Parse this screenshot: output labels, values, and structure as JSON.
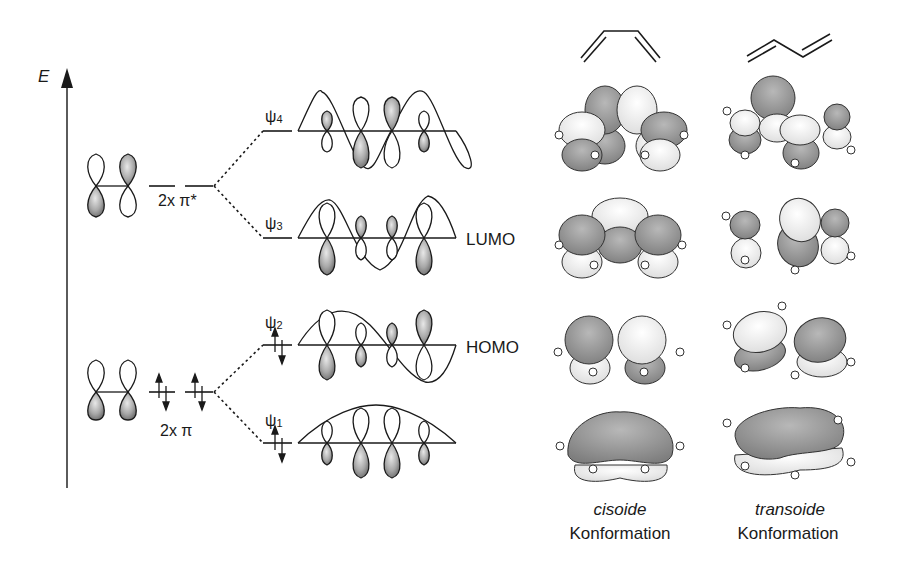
{
  "axis": {
    "label": "E"
  },
  "ethene_levels": {
    "antibonding_label": "2x π*",
    "bonding_label": "2x π"
  },
  "butadiene_mos": [
    {
      "name": "ψ",
      "index": "4",
      "tag": ""
    },
    {
      "name": "ψ",
      "index": "3",
      "tag": "LUMO"
    },
    {
      "name": "ψ",
      "index": "2",
      "tag": "HOMO"
    },
    {
      "name": "ψ",
      "index": "1",
      "tag": ""
    }
  ],
  "conformations": [
    {
      "name": "cisoide",
      "label": "Konformation"
    },
    {
      "name": "transoide",
      "label": "Konformation"
    }
  ],
  "colors": {
    "line": "#1a1a1a",
    "lobe_dark": "#8a8a8a",
    "lobe_mid": "#b5b5b5",
    "surface_dark": "#9a9a9a",
    "surface_light": "#f2f2f2"
  }
}
